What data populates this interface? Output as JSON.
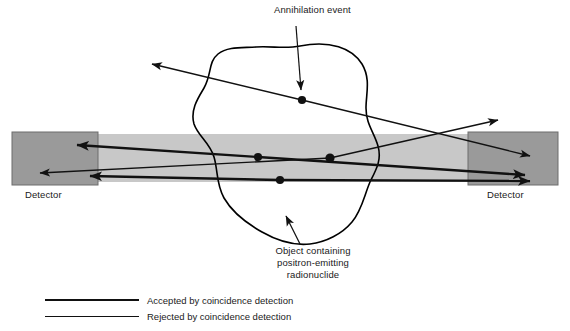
{
  "figure": {
    "type": "diagram"
  },
  "labels": {
    "annihilation_event": "Annihilation event",
    "detector_left": "Detector",
    "detector_right": "Detector",
    "object_caption_line1": "Object containing",
    "object_caption_line2": "positron-emitting",
    "object_caption_line3": "radionuclide"
  },
  "legend": {
    "items": [
      {
        "label": "Accepted by coincidence detection",
        "style": "thick",
        "color": "#111111"
      },
      {
        "label": "Rejected by coincidence detection",
        "style": "thin",
        "color": "#111111"
      }
    ]
  },
  "colors": {
    "detector_fill": "#9a9a9a",
    "detector_stroke": "#6d6d6d",
    "band_fill": "#c8c8c8",
    "line": "#111111",
    "object_outline": "#000000",
    "text": "#1a1a1a",
    "background": "#ffffff"
  },
  "geometry": {
    "canvas": {
      "width": 570,
      "height": 331
    },
    "field_of_view_band": {
      "x": 12,
      "y": 134,
      "width": 546,
      "height": 48
    },
    "detector_left_box": {
      "x": 12,
      "y": 132,
      "width": 86,
      "height": 53
    },
    "detector_right_box": {
      "x": 468,
      "y": 132,
      "width": 90,
      "height": 53
    },
    "annihilation_points": [
      {
        "id": "event-1",
        "x": 302,
        "y": 100,
        "note": "upper event, scattered photon pair rejected"
      },
      {
        "id": "event-2",
        "x": 258,
        "y": 157,
        "note": "mid-left event, accepted"
      },
      {
        "id": "event-3",
        "x": 330,
        "y": 158,
        "note": "mid-right event, one photon escapes"
      },
      {
        "id": "event-4",
        "x": 280,
        "y": 180,
        "note": "lower event, accepted"
      }
    ],
    "rays": [
      {
        "id": "ray-1a",
        "from": [
          302,
          100
        ],
        "to": [
          145,
          63
        ],
        "style": "thin",
        "arrow": true
      },
      {
        "id": "ray-1b",
        "from": [
          302,
          100
        ],
        "to": [
          537,
          157
        ],
        "style": "thin",
        "arrow": true
      },
      {
        "id": "ray-2a",
        "from": [
          258,
          157
        ],
        "to": [
          68,
          144
        ],
        "style": "thick",
        "arrow": true
      },
      {
        "id": "ray-2b",
        "from": [
          258,
          157
        ],
        "to": [
          535,
          176
        ],
        "style": "thick",
        "arrow": true
      },
      {
        "id": "ray-3a",
        "from": [
          330,
          158
        ],
        "to": [
          32,
          173
        ],
        "style": "thin",
        "arrow": true
      },
      {
        "id": "ray-3b",
        "from": [
          330,
          158
        ],
        "to": [
          505,
          119
        ],
        "style": "thin",
        "arrow": true
      },
      {
        "id": "ray-4a",
        "from": [
          280,
          180
        ],
        "to": [
          80,
          175
        ],
        "style": "thick",
        "arrow": true
      },
      {
        "id": "ray-4b",
        "from": [
          280,
          180
        ],
        "to": [
          541,
          181
        ],
        "style": "thick",
        "arrow": true
      }
    ],
    "pointer_annihilation": {
      "from": [
        296,
        26
      ],
      "to": [
        300,
        96
      ]
    },
    "pointer_object": {
      "from": [
        300,
        244
      ],
      "to": [
        283,
        210
      ]
    }
  }
}
